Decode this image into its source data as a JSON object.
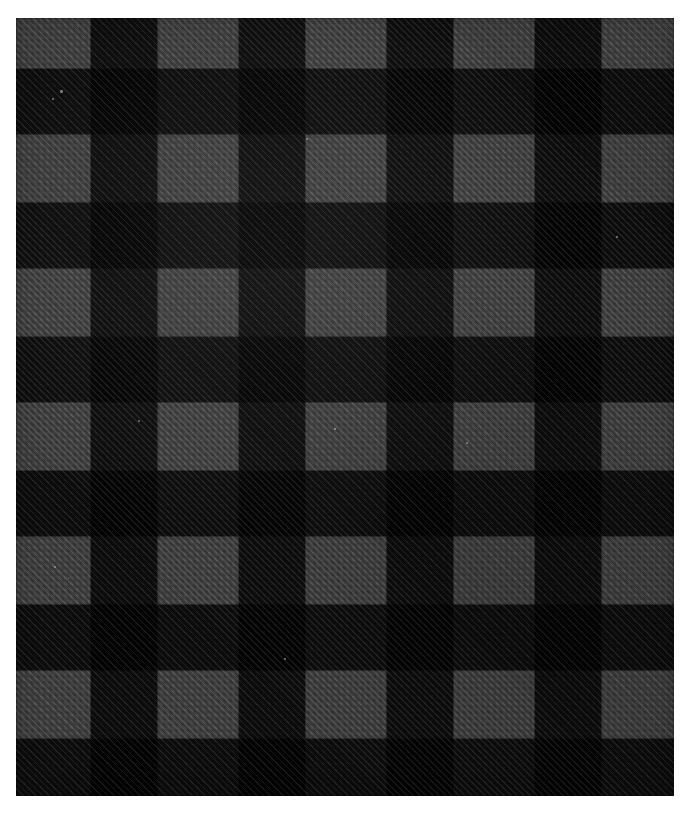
{
  "image": {
    "subject": "buffalo-plaid-fabric-swatch",
    "title": "Buffalo plaid fabric swatch",
    "description": "Close-up photograph of a woven buffalo check (buffalo plaid) flannel fabric in black and charcoal grey, showing a visible diagonal twill weave.",
    "width_px": 690,
    "height_px": 816,
    "background_color": "#ffffff"
  },
  "swatch": {
    "left_px": 16,
    "top_px": 18,
    "width_px": 658,
    "height_px": 778,
    "weave": "twill",
    "twill_angle_deg": 45,
    "pattern_name": "buffalo check"
  },
  "pattern": {
    "column_band_px": 74,
    "column_period_px": 148,
    "row_band_px": 67,
    "row_period_px": 134,
    "first_row_offset_px": -17,
    "column_sequence": [
      "light",
      "dark",
      "light",
      "dark",
      "light",
      "dark",
      "light",
      "dark",
      "light"
    ],
    "row_sequence": [
      "light",
      "dark",
      "light",
      "dark",
      "light",
      "dark",
      "light",
      "dark",
      "light",
      "dark",
      "light",
      "dark"
    ]
  },
  "colors": {
    "light_square": "#3d3d3d",
    "mid_square": "#1f1f1f",
    "dark_square": "#090909",
    "border": "#ffffff",
    "fleck": "#cfcfcf"
  },
  "flecks": [
    {
      "left_px": 44,
      "top_px": 72,
      "size_px": 2.5
    },
    {
      "left_px": 36,
      "top_px": 80,
      "size_px": 1.6
    },
    {
      "left_px": 122,
      "top_px": 402,
      "size_px": 2.0
    },
    {
      "left_px": 290,
      "top_px": 120,
      "size_px": 1.8
    },
    {
      "left_px": 318,
      "top_px": 410,
      "size_px": 1.7
    },
    {
      "left_px": 450,
      "top_px": 424,
      "size_px": 2.2
    },
    {
      "left_px": 600,
      "top_px": 218,
      "size_px": 1.5
    },
    {
      "left_px": 38,
      "top_px": 548,
      "size_px": 2.4
    },
    {
      "left_px": 52,
      "top_px": 560,
      "size_px": 1.4
    },
    {
      "left_px": 268,
      "top_px": 640,
      "size_px": 1.6
    }
  ]
}
